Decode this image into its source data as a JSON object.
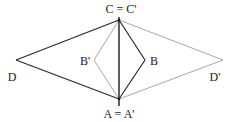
{
  "diagram": {
    "type": "geometry-reflection",
    "colors": {
      "original": "#2a2a2a",
      "reflected": "#a8a8a8",
      "axis": "#1a1a1a"
    },
    "points": {
      "C": {
        "x": 119,
        "y": 20
      },
      "A": {
        "x": 119,
        "y": 99
      },
      "D": {
        "x": 16,
        "y": 60
      },
      "B": {
        "x": 145,
        "y": 60
      },
      "Bp": {
        "x": 94,
        "y": 60
      },
      "Dp": {
        "x": 223,
        "y": 60
      }
    },
    "labels": {
      "C": "C = C'",
      "A": "A = A'",
      "D": "D",
      "B": "B",
      "Bp": "B'",
      "Dp": "D'"
    },
    "edges_original": [
      [
        "C",
        "D"
      ],
      [
        "D",
        "A"
      ],
      [
        "C",
        "B"
      ],
      [
        "B",
        "A"
      ]
    ],
    "edges_reflected": [
      [
        "C",
        "Bp"
      ],
      [
        "Bp",
        "A"
      ],
      [
        "C",
        "Dp"
      ],
      [
        "Dp",
        "A"
      ]
    ],
    "axis": {
      "from": "C",
      "to": "A"
    }
  }
}
